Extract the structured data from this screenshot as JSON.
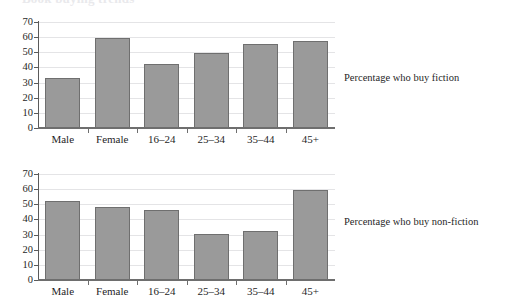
{
  "page": {
    "cropped_heading": "Book buying trends"
  },
  "axis": {
    "yticks": [
      0,
      10,
      20,
      30,
      40,
      50,
      60,
      70
    ],
    "ymin": 0,
    "ymax": 70,
    "categories": [
      "Male",
      "Female",
      "16–24",
      "25–34",
      "35–44",
      "45+"
    ]
  },
  "charts": [
    {
      "caption": "Percentage who buy fiction",
      "values": [
        33,
        59.5,
        42.5,
        49.5,
        55.5,
        57.5
      ]
    },
    {
      "caption": "Percentage who buy non-fiction",
      "values": [
        52,
        48,
        46,
        30.5,
        32.5,
        59.5
      ]
    }
  ],
  "style": {
    "bar_fill": "#9a9a9a",
    "bar_stroke": "#6f6f6f",
    "grid": "#e4e4e6",
    "axis": "#6e6e6e",
    "background": "#ffffff"
  },
  "chart_data": [
    {
      "type": "bar",
      "title": "Percentage who buy fiction",
      "xlabel": "",
      "ylabel": "",
      "categories": [
        "Male",
        "Female",
        "16–24",
        "25–34",
        "35–44",
        "45+"
      ],
      "values": [
        33,
        59.5,
        42.5,
        49.5,
        55.5,
        57.5
      ],
      "ylim": [
        0,
        70
      ],
      "ytick_step": 10,
      "grid": true,
      "legend": "none",
      "annotation_position": "right"
    },
    {
      "type": "bar",
      "title": "Percentage who buy non-fiction",
      "xlabel": "",
      "ylabel": "",
      "categories": [
        "Male",
        "Female",
        "16–24",
        "25–34",
        "35–44",
        "45+"
      ],
      "values": [
        52,
        48,
        46,
        30.5,
        32.5,
        59.5
      ],
      "ylim": [
        0,
        70
      ],
      "ytick_step": 10,
      "grid": true,
      "legend": "none",
      "annotation_position": "right"
    }
  ]
}
